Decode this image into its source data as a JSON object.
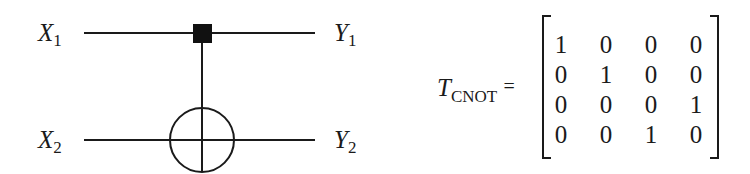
{
  "circuit": {
    "gate": "CNOT",
    "inputs": [
      {
        "symbol": "X",
        "index": "1"
      },
      {
        "symbol": "X",
        "index": "2"
      }
    ],
    "outputs": [
      {
        "symbol": "Y",
        "index": "1"
      },
      {
        "symbol": "Y",
        "index": "2"
      }
    ],
    "control_wire": 1,
    "target_wire": 2,
    "line_color": "#1a1a1a"
  },
  "equation": {
    "symbol": "T",
    "subscript": "CNOT",
    "equals": "=",
    "matrix": [
      [
        "1",
        "0",
        "0",
        "0"
      ],
      [
        "0",
        "1",
        "0",
        "0"
      ],
      [
        "0",
        "0",
        "0",
        "1"
      ],
      [
        "0",
        "0",
        "1",
        "0"
      ]
    ]
  }
}
